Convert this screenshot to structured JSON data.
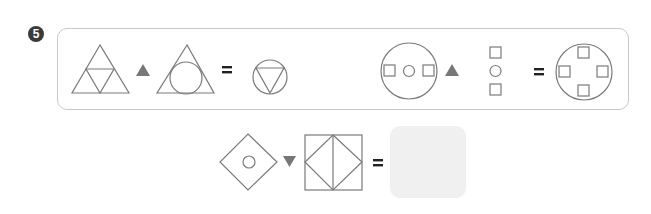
{
  "problem": {
    "number_label": "5",
    "number_badge_style": "filled-circle-digit"
  },
  "colors": {
    "stroke": "#7a7a7a",
    "operator_fill": "#777777",
    "panel_border": "#c8c8c8",
    "answer_box_fill": "#f0f0f0",
    "badge_fill": "#3a3a3a"
  },
  "example_panel": {
    "examples": [
      {
        "left_operand": "triangle-subdivided-into-4-triangles",
        "operator": "upward-filled-triangle",
        "right_operand": "triangle-with-inscribed-circle",
        "equals": "=",
        "result": "circle-with-inscribed-inverted-triangle"
      },
      {
        "left_operand": "circle-containing-square-circle-square-horizontal",
        "operator": "upward-filled-triangle",
        "right_operand": "square-circle-square-vertical-stack",
        "equals": "=",
        "result": "circle-containing-four-squares-top-bottom-left-right"
      }
    ]
  },
  "question": {
    "left_operand": "diamond-with-small-circle",
    "operator": "downward-filled-triangle",
    "right_operand": "square-with-inscribed-diamond-and-vertical-line",
    "equals": "=",
    "answer_placeholder": ""
  }
}
